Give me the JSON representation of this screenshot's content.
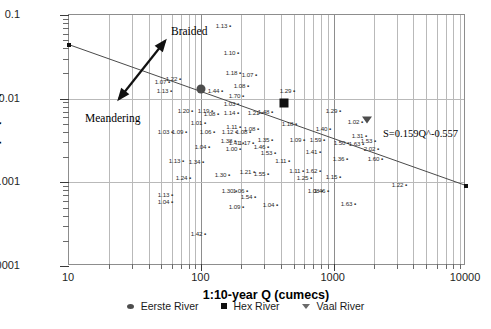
{
  "chart_data": {
    "type": "scatter",
    "title": "",
    "xlabel": "1:10-year Q (cumecs)",
    "ylabel": "Slope (m/m)",
    "xscale": "log",
    "yscale": "log",
    "xlim": [
      10,
      10000
    ],
    "ylim": [
      0.0001,
      0.1
    ],
    "xticks": [
      "10",
      "100",
      "1000",
      "10000"
    ],
    "yticks": [
      "0.1",
      "0.01",
      "0.001",
      "0.0001"
    ],
    "grid": "both-log-minor",
    "legend_position": "bottom-center",
    "trendline": {
      "equation": "S=0.159Q^-0.557",
      "coefficient": 0.159,
      "exponent": -0.557,
      "x_start": 10,
      "y_start": 0.0442,
      "x_end": 10000,
      "y_end": 0.000915
    },
    "annotations": [
      {
        "text": "Braided",
        "x": 170,
        "y": 24
      },
      {
        "text": "Meandering",
        "x": 84,
        "y": 111
      }
    ],
    "arrow": {
      "name": "braided-meandering-arrow",
      "x1": 118,
      "y1": 98,
      "x2": 164,
      "y2": 40,
      "double_headed": true
    },
    "series": [
      {
        "name": "Eerste River",
        "marker": "circle",
        "points": [
          {
            "x": 100,
            "y": 0.0132
          }
        ]
      },
      {
        "name": "Hex River",
        "marker": "square",
        "points": [
          {
            "x": 420,
            "y": 0.0088
          }
        ]
      },
      {
        "name": "Vaal River",
        "marker": "triangle",
        "points": [
          {
            "x": 1800,
            "y": 0.0055
          }
        ]
      }
    ],
    "point_labels": [
      {
        "v": "1.13",
        "px": 230,
        "py": 25
      },
      {
        "v": "1.10",
        "px": 238,
        "py": 52
      },
      {
        "v": "1.18",
        "px": 240,
        "py": 72
      },
      {
        "v": "1.07",
        "px": 256,
        "py": 74
      },
      {
        "v": "1.08",
        "px": 248,
        "py": 85
      },
      {
        "v": "1.07",
        "px": 169,
        "py": 81
      },
      {
        "v": "1.22",
        "px": 180,
        "py": 78
      },
      {
        "v": "1.13",
        "px": 171,
        "py": 90
      },
      {
        "v": "1.44",
        "px": 222,
        "py": 90
      },
      {
        "v": "1.70",
        "px": 243,
        "py": 95
      },
      {
        "v": "1.29",
        "px": 294,
        "py": 90
      },
      {
        "v": "1.03",
        "px": 238,
        "py": 103
      },
      {
        "v": "1.19",
        "px": 212,
        "py": 110
      },
      {
        "v": "1.08",
        "px": 218,
        "py": 113
      },
      {
        "v": "1.14",
        "px": 238,
        "py": 112
      },
      {
        "v": "1.21",
        "px": 262,
        "py": 112
      },
      {
        "v": "1.48",
        "px": 272,
        "py": 111
      },
      {
        "v": "1.29",
        "px": 340,
        "py": 110
      },
      {
        "v": "1.02",
        "px": 362,
        "py": 121
      },
      {
        "v": "1.20",
        "px": 192,
        "py": 110
      },
      {
        "v": "1.01",
        "px": 205,
        "py": 122
      },
      {
        "v": "1.09",
        "px": 186,
        "py": 131
      },
      {
        "v": "1.06",
        "px": 214,
        "py": 131
      },
      {
        "v": "1.11",
        "px": 240,
        "py": 126
      },
      {
        "v": "1.08",
        "px": 258,
        "py": 128
      },
      {
        "v": "1.18",
        "px": 296,
        "py": 123
      },
      {
        "v": "1.40",
        "px": 330,
        "py": 128
      },
      {
        "v": "1.12",
        "px": 236,
        "py": 131
      },
      {
        "v": "1.08",
        "px": 250,
        "py": 131
      },
      {
        "v": "1.38",
        "px": 235,
        "py": 140
      },
      {
        "v": "1.41",
        "px": 243,
        "py": 142
      },
      {
        "v": "1.17",
        "px": 253,
        "py": 142
      },
      {
        "v": "1.35",
        "px": 272,
        "py": 139
      },
      {
        "v": "1.09",
        "px": 304,
        "py": 139
      },
      {
        "v": "1.59",
        "px": 324,
        "py": 139
      },
      {
        "v": "1.31",
        "px": 366,
        "py": 135
      },
      {
        "v": "1.50",
        "px": 348,
        "py": 142
      },
      {
        "v": "1.53",
        "px": 375,
        "py": 140
      },
      {
        "v": "1.04",
        "px": 209,
        "py": 146
      },
      {
        "v": "1.00",
        "px": 240,
        "py": 148
      },
      {
        "v": "1.46",
        "px": 268,
        "py": 146
      },
      {
        "v": "1.53",
        "px": 275,
        "py": 152
      },
      {
        "v": "1.41",
        "px": 320,
        "py": 151
      },
      {
        "v": "2.02",
        "px": 378,
        "py": 148
      },
      {
        "v": "1.63",
        "px": 363,
        "py": 143
      },
      {
        "v": "1.60",
        "px": 382,
        "py": 158
      },
      {
        "v": "1.03",
        "px": 172,
        "py": 131
      },
      {
        "v": "1.13",
        "px": 183,
        "py": 160
      },
      {
        "v": "1.34",
        "px": 203,
        "py": 161
      },
      {
        "v": "1.11",
        "px": 289,
        "py": 160
      },
      {
        "v": "1.36",
        "px": 347,
        "py": 158
      },
      {
        "v": "1.24",
        "px": 190,
        "py": 177
      },
      {
        "v": "1.30",
        "px": 229,
        "py": 174
      },
      {
        "v": "1.21",
        "px": 254,
        "py": 171
      },
      {
        "v": "1.55",
        "px": 268,
        "py": 173
      },
      {
        "v": "1.11",
        "px": 303,
        "py": 170
      },
      {
        "v": "1.62",
        "px": 320,
        "py": 170
      },
      {
        "v": "1.25",
        "px": 311,
        "py": 177
      },
      {
        "v": "1.15",
        "px": 340,
        "py": 176
      },
      {
        "v": "1.22",
        "px": 406,
        "py": 184
      },
      {
        "v": "1.13",
        "px": 172,
        "py": 194
      },
      {
        "v": "1.04",
        "px": 172,
        "py": 201
      },
      {
        "v": "1.30",
        "px": 236,
        "py": 190
      },
      {
        "v": "1.06",
        "px": 247,
        "py": 190
      },
      {
        "v": "1.54",
        "px": 255,
        "py": 196
      },
      {
        "v": "1.08",
        "px": 322,
        "py": 190
      },
      {
        "v": "1.46",
        "px": 328,
        "py": 190
      },
      {
        "v": "1.09",
        "px": 243,
        "py": 206
      },
      {
        "v": "1.04",
        "px": 277,
        "py": 204
      },
      {
        "v": "1.63",
        "px": 355,
        "py": 203
      },
      {
        "v": "1.42",
        "px": 205,
        "py": 233
      }
    ]
  },
  "legend": {
    "items": [
      {
        "label": "Eerste River",
        "marker": "circle"
      },
      {
        "label": "Hex River",
        "marker": "square"
      },
      {
        "label": "Vaal River",
        "marker": "triangle"
      }
    ]
  }
}
